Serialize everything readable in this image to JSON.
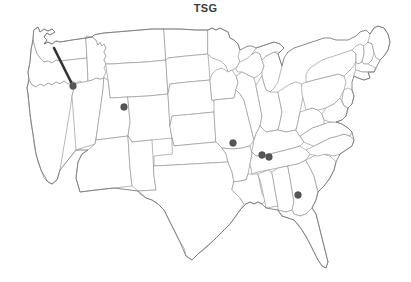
{
  "figure": {
    "title": "TSG",
    "type": "point-map",
    "region": "United States",
    "background_color": "#ffffff",
    "border_color": "#9a9a9a",
    "marker_color": "#565656",
    "annotation_color": "#333333"
  },
  "chart_data": {
    "type": "scatter",
    "title": "TSG",
    "xlabel": "",
    "ylabel": "",
    "projection": "US state outline map",
    "grid": false,
    "legend": "none",
    "xlim": [
      0,
      411
    ],
    "ylim": [
      0,
      264
    ],
    "series": [
      {
        "name": "TSG sample locations",
        "marker": "filled-circle",
        "color": "#565656",
        "points": [
          {
            "label": "Idaho",
            "x": 73,
            "y": 68,
            "state": "ID"
          },
          {
            "label": "Wyoming",
            "x": 124,
            "y": 89,
            "state": "WY"
          },
          {
            "label": "Missouri",
            "x": 233,
            "y": 125,
            "state": "MO"
          },
          {
            "label": "Kentucky-Tennessee border west",
            "x": 262,
            "y": 137,
            "state": "KY"
          },
          {
            "label": "Kentucky-Tennessee border east",
            "x": 269,
            "y": 139,
            "state": "KY"
          },
          {
            "label": "Georgia",
            "x": 298,
            "y": 177,
            "state": "GA"
          }
        ]
      }
    ],
    "annotations": [
      {
        "type": "line",
        "label": "leader line to Idaho point",
        "x1": 54,
        "y1": 30,
        "x2": 71,
        "y2": 64,
        "color": "#333333",
        "width": 2.6
      }
    ]
  },
  "accessibility": {
    "map_alt": "Outline map of the contiguous United States with state boundaries and six filled circular markers"
  }
}
